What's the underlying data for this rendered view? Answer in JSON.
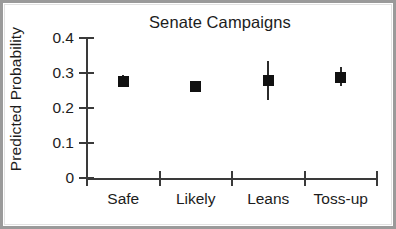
{
  "chart_data": {
    "type": "scatter",
    "title": "Senate Campaigns",
    "xlabel": "",
    "ylabel": "Predicted Probability",
    "categories": [
      "Safe",
      "Likely",
      "Leans",
      "Toss-up"
    ],
    "values": [
      0.277,
      0.262,
      0.278,
      0.288
    ],
    "error_low": [
      0.262,
      0.248,
      0.222,
      0.262
    ],
    "error_high": [
      0.293,
      0.278,
      0.335,
      0.318
    ],
    "ylim": [
      0,
      0.4
    ],
    "ytick_labels": [
      "0",
      "0.1",
      "0.2",
      "0.3",
      "0.4"
    ],
    "ytick_values": [
      0,
      0.1,
      0.2,
      0.3,
      0.4
    ],
    "grid": false,
    "legend": "none",
    "marker_style": "filled-square",
    "marker_color": "#111111",
    "errorbar_color": "#2b2b2b",
    "axis_color": "#3a3a3a",
    "background_color": "#ffffff",
    "frame_color": "#9a9a9a",
    "points": [
      {
        "category": "Safe",
        "value": 0.277,
        "low": 0.262,
        "high": 0.293
      },
      {
        "category": "Likely",
        "value": 0.262,
        "low": 0.248,
        "high": 0.278
      },
      {
        "category": "Leans",
        "value": 0.278,
        "low": 0.222,
        "high": 0.335
      },
      {
        "category": "Toss-up",
        "value": 0.288,
        "low": 0.262,
        "high": 0.318
      }
    ]
  }
}
